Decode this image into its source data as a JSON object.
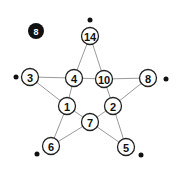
{
  "badge": {
    "label": "8",
    "x": 36,
    "y": 31,
    "r": 8
  },
  "colors": {
    "edge": "#9a9a9a",
    "node_stroke": "#222222",
    "node_fill": "#ffffff",
    "dot": "#111111",
    "badge": "#111111"
  },
  "node_radius": 8.5,
  "nodes": [
    {
      "id": "n14",
      "label": "14",
      "x": 90,
      "y": 36
    },
    {
      "id": "n3",
      "label": "3",
      "x": 30,
      "y": 77
    },
    {
      "id": "n4",
      "label": "4",
      "x": 74,
      "y": 78
    },
    {
      "id": "n10",
      "label": "10",
      "x": 104,
      "y": 79
    },
    {
      "id": "n8",
      "label": "8",
      "x": 148,
      "y": 78
    },
    {
      "id": "n1",
      "label": "1",
      "x": 67,
      "y": 106
    },
    {
      "id": "n2",
      "label": "2",
      "x": 113,
      "y": 106
    },
    {
      "id": "n7",
      "label": "7",
      "x": 90,
      "y": 122
    },
    {
      "id": "n6",
      "label": "6",
      "x": 51,
      "y": 146
    },
    {
      "id": "n5",
      "label": "5",
      "x": 126,
      "y": 147
    }
  ],
  "edges": [
    [
      "n14",
      "n4"
    ],
    [
      "n14",
      "n10"
    ],
    [
      "n3",
      "n4"
    ],
    [
      "n4",
      "n10"
    ],
    [
      "n10",
      "n8"
    ],
    [
      "n3",
      "n1"
    ],
    [
      "n4",
      "n1"
    ],
    [
      "n10",
      "n2"
    ],
    [
      "n8",
      "n2"
    ],
    [
      "n1",
      "n7"
    ],
    [
      "n2",
      "n7"
    ],
    [
      "n1",
      "n6"
    ],
    [
      "n7",
      "n6"
    ],
    [
      "n7",
      "n5"
    ],
    [
      "n2",
      "n5"
    ]
  ],
  "dots": [
    {
      "id": "dot-14",
      "x": 90,
      "y": 20,
      "r": 2.5
    },
    {
      "id": "dot-3",
      "x": 16,
      "y": 77,
      "r": 2.5
    },
    {
      "id": "dot-8",
      "x": 166,
      "y": 79,
      "r": 2.5
    },
    {
      "id": "dot-6",
      "x": 37,
      "y": 154,
      "r": 2.5
    },
    {
      "id": "dot-5",
      "x": 141,
      "y": 155,
      "r": 2.5
    }
  ]
}
